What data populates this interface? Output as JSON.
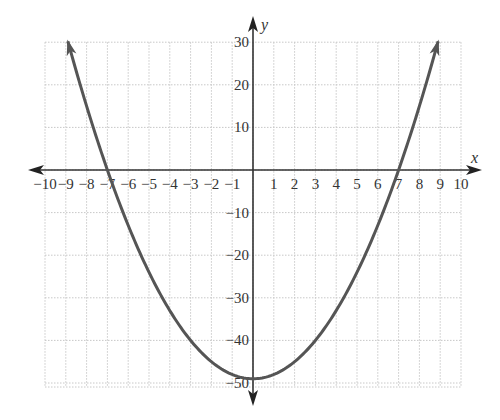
{
  "chart_data": {
    "type": "line",
    "title": "",
    "xlabel": "x",
    "ylabel": "y",
    "xlim": [
      -10,
      10
    ],
    "ylim": [
      -50,
      30
    ],
    "grid": true,
    "x_ticks": [
      -10,
      -9,
      -8,
      -7,
      -6,
      -5,
      -4,
      -3,
      -2,
      -1,
      1,
      2,
      3,
      4,
      5,
      6,
      7,
      8,
      9,
      10
    ],
    "y_ticks": [
      30,
      20,
      10,
      -10,
      -20,
      -30,
      -40,
      -50
    ],
    "x_tick_labels": [
      "−10",
      "−9",
      "−8",
      "−7",
      "−6",
      "−5",
      "−4",
      "−3",
      "−2",
      "−1",
      "1",
      "2",
      "3",
      "4",
      "5",
      "6",
      "7",
      "8",
      "9",
      "10"
    ],
    "y_tick_labels": [
      "30",
      "20",
      "10",
      "−10",
      "−20",
      "−30",
      "−40",
      "−50"
    ],
    "series": [
      {
        "name": "parabola",
        "equation": "y = x^2 - 49",
        "x_range": [
          -8.9,
          8.9
        ],
        "vertex": [
          0,
          -49
        ],
        "x_intercepts": [
          -7,
          7
        ],
        "arrows_at_ends": true,
        "color": "#555555"
      }
    ]
  }
}
